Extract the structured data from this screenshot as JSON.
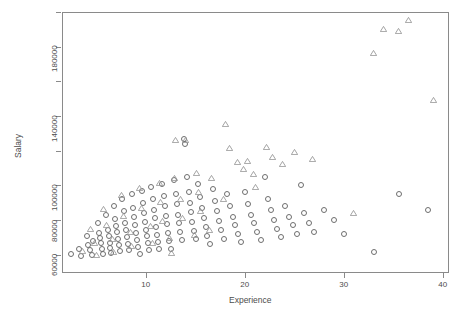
{
  "chart_data": {
    "type": "scatter",
    "title": "",
    "xlabel": "Experience",
    "ylabel": "Salary",
    "xlim": [
      1.5,
      40.5
    ],
    "ylim": [
      50000,
      200000
    ],
    "xticks": [
      10,
      20,
      30,
      40
    ],
    "xtick_labels": [
      "10",
      "20",
      "30",
      "40"
    ],
    "yticks": [
      60000,
      80000,
      100000,
      120000,
      140000,
      160000,
      180000,
      200000
    ],
    "ytick_labels": [
      "60000",
      "80000",
      "100000",
      "",
      "140000",
      "",
      "180000",
      ""
    ],
    "grid": false,
    "legend": null,
    "marker_colors": {
      "circle": "#6e6e6e",
      "triangle": "#9a9a9a"
    },
    "axis_color": "#8a8a8a",
    "text_color": "#4d4d4d",
    "series": [
      {
        "name": "circle",
        "marker": "circle",
        "points": [
          [
            2.4,
            60500
          ],
          [
            3.2,
            63500
          ],
          [
            3.4,
            59500
          ],
          [
            4.0,
            71000
          ],
          [
            4.1,
            65500
          ],
          [
            4.3,
            62500
          ],
          [
            4.5,
            60000
          ],
          [
            4.6,
            68000
          ],
          [
            5.1,
            78000
          ],
          [
            5.2,
            72500
          ],
          [
            5.3,
            69500
          ],
          [
            5.4,
            66500
          ],
          [
            5.5,
            63000
          ],
          [
            5.6,
            60500
          ],
          [
            5.9,
            83000
          ],
          [
            6.1,
            74500
          ],
          [
            6.2,
            70500
          ],
          [
            6.3,
            67000
          ],
          [
            6.4,
            64000
          ],
          [
            6.5,
            61000
          ],
          [
            6.8,
            88000
          ],
          [
            6.9,
            80500
          ],
          [
            7.0,
            76500
          ],
          [
            7.1,
            73000
          ],
          [
            7.2,
            69000
          ],
          [
            7.3,
            65500
          ],
          [
            7.4,
            62000
          ],
          [
            7.6,
            92000
          ],
          [
            7.8,
            85000
          ],
          [
            7.9,
            78500
          ],
          [
            8.0,
            74000
          ],
          [
            8.1,
            70000
          ],
          [
            8.2,
            66000
          ],
          [
            8.3,
            62500
          ],
          [
            8.6,
            95000
          ],
          [
            8.7,
            87000
          ],
          [
            8.8,
            82000
          ],
          [
            8.9,
            77000
          ],
          [
            9.0,
            72500
          ],
          [
            9.1,
            68500
          ],
          [
            9.2,
            64500
          ],
          [
            9.4,
            60500
          ],
          [
            9.6,
            97000
          ],
          [
            9.7,
            90000
          ],
          [
            9.8,
            84000
          ],
          [
            9.9,
            79000
          ],
          [
            10.0,
            74500
          ],
          [
            10.1,
            70500
          ],
          [
            10.2,
            66500
          ],
          [
            10.3,
            62500
          ],
          [
            10.5,
            99000
          ],
          [
            10.7,
            92000
          ],
          [
            10.8,
            86000
          ],
          [
            10.9,
            81000
          ],
          [
            11.0,
            76000
          ],
          [
            11.1,
            71500
          ],
          [
            11.2,
            67500
          ],
          [
            11.3,
            63500
          ],
          [
            11.6,
            101000
          ],
          [
            11.8,
            94000
          ],
          [
            11.9,
            88000
          ],
          [
            12.0,
            82500
          ],
          [
            12.1,
            77500
          ],
          [
            12.2,
            72500
          ],
          [
            12.3,
            68000
          ],
          [
            12.5,
            63500
          ],
          [
            12.8,
            103000
          ],
          [
            13.0,
            95000
          ],
          [
            13.1,
            89000
          ],
          [
            13.2,
            83000
          ],
          [
            13.3,
            78000
          ],
          [
            13.4,
            73000
          ],
          [
            13.6,
            68500
          ],
          [
            13.8,
            127000
          ],
          [
            13.9,
            124000
          ],
          [
            14.1,
            105000
          ],
          [
            14.3,
            96000
          ],
          [
            14.4,
            90000
          ],
          [
            14.5,
            84500
          ],
          [
            14.6,
            79000
          ],
          [
            14.8,
            73500
          ],
          [
            15.0,
            69000
          ],
          [
            15.2,
            101000
          ],
          [
            15.4,
            93000
          ],
          [
            15.6,
            87000
          ],
          [
            15.8,
            81000
          ],
          [
            16.0,
            76000
          ],
          [
            16.2,
            71000
          ],
          [
            16.5,
            66000
          ],
          [
            16.8,
            98000
          ],
          [
            17.0,
            91000
          ],
          [
            17.2,
            85000
          ],
          [
            17.4,
            79500
          ],
          [
            17.6,
            74000
          ],
          [
            17.9,
            69000
          ],
          [
            18.2,
            95000
          ],
          [
            18.5,
            88000
          ],
          [
            18.8,
            82000
          ],
          [
            19.0,
            77000
          ],
          [
            19.3,
            72000
          ],
          [
            19.6,
            67500
          ],
          [
            20.0,
            96000
          ],
          [
            20.3,
            89000
          ],
          [
            20.6,
            83000
          ],
          [
            20.9,
            78000
          ],
          [
            21.2,
            73000
          ],
          [
            21.6,
            68500
          ],
          [
            22.0,
            105000
          ],
          [
            22.3,
            92000
          ],
          [
            22.6,
            86000
          ],
          [
            22.9,
            80000
          ],
          [
            23.2,
            75000
          ],
          [
            23.6,
            70000
          ],
          [
            24.0,
            88000
          ],
          [
            24.4,
            82000
          ],
          [
            24.8,
            77000
          ],
          [
            25.2,
            72000
          ],
          [
            25.6,
            100000
          ],
          [
            26.0,
            84000
          ],
          [
            26.5,
            78000
          ],
          [
            27.0,
            73000
          ],
          [
            28.0,
            86000
          ],
          [
            29.0,
            80000
          ],
          [
            30.0,
            72000
          ],
          [
            33.0,
            61500
          ],
          [
            35.5,
            95000
          ],
          [
            38.5,
            86000
          ]
        ]
      },
      {
        "name": "triangle",
        "marker": "triangle",
        "points": [
          [
            3.6,
            62000
          ],
          [
            4.4,
            74500
          ],
          [
            4.8,
            66500
          ],
          [
            5.0,
            59500
          ],
          [
            5.7,
            86000
          ],
          [
            6.0,
            77000
          ],
          [
            6.6,
            69000
          ],
          [
            6.7,
            61500
          ],
          [
            7.5,
            94000
          ],
          [
            7.7,
            82000
          ],
          [
            8.4,
            73000
          ],
          [
            8.5,
            64500
          ],
          [
            9.3,
            98000
          ],
          [
            9.5,
            86500
          ],
          [
            10.4,
            76000
          ],
          [
            10.6,
            66500
          ],
          [
            11.4,
            101000
          ],
          [
            11.5,
            90000
          ],
          [
            11.7,
            79000
          ],
          [
            12.4,
            69500
          ],
          [
            12.6,
            60500
          ],
          [
            12.9,
            104000
          ],
          [
            13.5,
            92000
          ],
          [
            13.7,
            81000
          ],
          [
            13.0,
            126000
          ],
          [
            14.0,
            126000
          ],
          [
            14.9,
            71000
          ],
          [
            15.1,
            107000
          ],
          [
            15.3,
            96000
          ],
          [
            15.5,
            85000
          ],
          [
            16.4,
            74000
          ],
          [
            16.6,
            104000
          ],
          [
            17.8,
            92000
          ],
          [
            18.0,
            135000
          ],
          [
            18.4,
            121000
          ],
          [
            19.2,
            113000
          ],
          [
            19.8,
            109000
          ],
          [
            20.2,
            114000
          ],
          [
            20.8,
            106000
          ],
          [
            21.0,
            99000
          ],
          [
            22.2,
            122000
          ],
          [
            22.8,
            116000
          ],
          [
            23.8,
            112000
          ],
          [
            25.0,
            119000
          ],
          [
            26.8,
            115000
          ],
          [
            31.0,
            84000
          ],
          [
            33.0,
            176000
          ],
          [
            34.0,
            190000
          ],
          [
            35.5,
            189000
          ],
          [
            36.5,
            195000
          ],
          [
            39.0,
            149000
          ]
        ]
      }
    ]
  },
  "layout": {
    "plot_left": 62,
    "plot_top": 12,
    "plot_right": 448,
    "plot_bottom": 272
  }
}
